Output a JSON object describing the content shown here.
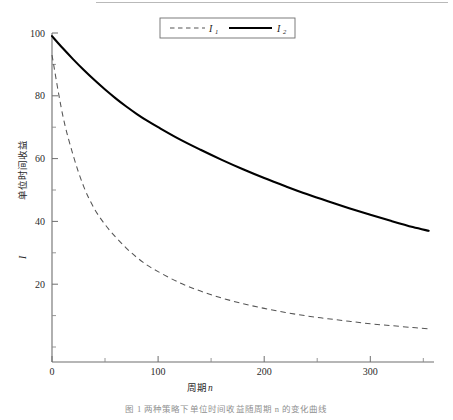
{
  "figure": {
    "caption": "图 1   两种策略下单位时间收益随周期 n 的变化曲线"
  },
  "legend": {
    "position": "top-center",
    "entries": [
      {
        "label": "I",
        "subscript": "1",
        "style": "dashed",
        "color": "#555555"
      },
      {
        "label": "I",
        "subscript": "2",
        "style": "solid",
        "color": "#000000"
      }
    ]
  },
  "axes": {
    "x": {
      "title_text": "周期",
      "title_var": "n",
      "ticks": [
        "0",
        "100",
        "200",
        "300"
      ],
      "tick_values": [
        0,
        100,
        200,
        300
      ],
      "minor_tick_values": [
        50,
        150,
        250,
        350
      ],
      "range": [
        0,
        360
      ]
    },
    "y": {
      "title_text": "单位时间收益",
      "title_var": "I",
      "ticks": [
        "20",
        "40",
        "60",
        "80",
        "100"
      ],
      "tick_values": [
        20,
        40,
        60,
        80,
        100
      ],
      "minor_tick_values": [
        10,
        30,
        50,
        70,
        90
      ],
      "range": [
        0,
        105
      ]
    }
  },
  "chart_data": {
    "type": "line",
    "title": "",
    "xlabel": "周期n",
    "ylabel": "单位时间收益I",
    "xlim": [
      0,
      360
    ],
    "ylim": [
      0,
      105
    ],
    "grid": false,
    "legend_position": "top-center",
    "x": [
      0,
      10,
      20,
      30,
      40,
      50,
      60,
      70,
      80,
      90,
      100,
      120,
      140,
      160,
      180,
      200,
      220,
      240,
      260,
      280,
      300,
      320,
      340,
      355
    ],
    "series": [
      {
        "name": "I1",
        "style": "dashed",
        "color": "#555555",
        "values": [
          93,
          74,
          61,
          51,
          44,
          39,
          35,
          31.5,
          28.5,
          26,
          24,
          20.5,
          17.8,
          15.6,
          13.8,
          12.3,
          11.0,
          9.9,
          9.0,
          8.2,
          7.4,
          6.8,
          6.2,
          5.8
        ]
      },
      {
        "name": "I2",
        "style": "solid",
        "color": "#000000",
        "values": [
          99,
          95.2,
          91.6,
          88.2,
          85.0,
          82.0,
          79.2,
          76.6,
          74.2,
          72.0,
          70.0,
          66.2,
          62.8,
          59.6,
          56.6,
          53.8,
          51.2,
          48.7,
          46.4,
          44.2,
          42.1,
          40.1,
          38.2,
          37.0
        ]
      }
    ]
  }
}
